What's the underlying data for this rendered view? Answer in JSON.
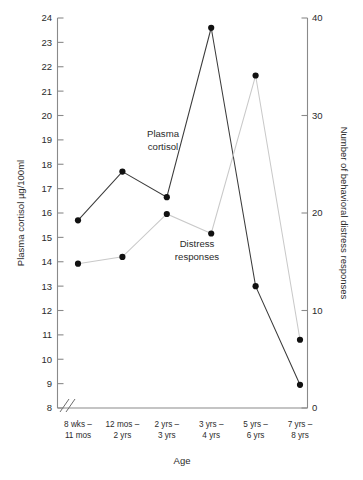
{
  "chart_data": {
    "type": "line",
    "title": "",
    "subtitle": "",
    "xlabel": "Age",
    "ylabel": "Plasma cortisol µg/100ml",
    "y2label": "Number of behavioral distress responses",
    "categories": [
      "8 wks –\n11 mos",
      "12 mos –\n2 yrs",
      "2 yrs –\n3 yrs",
      "3 yrs –\n4 yrs",
      "5 yrs –\n6 yrs",
      "7 yrs –\n8 yrs"
    ],
    "categories_line1": [
      "8 wks –",
      "12 mos –",
      "2 yrs –",
      "3 yrs –",
      "5 yrs –",
      "7 yrs –"
    ],
    "categories_line2": [
      "11 mos",
      "2 yrs",
      "3 yrs",
      "4 yrs",
      "6 yrs",
      "8 yrs"
    ],
    "ylim": [
      8,
      24
    ],
    "yticks": [
      8,
      9,
      10,
      11,
      12,
      13,
      14,
      15,
      16,
      17,
      18,
      19,
      20,
      21,
      22,
      23,
      24
    ],
    "ytick_labels": [
      "8",
      "9",
      "10",
      "11",
      "12",
      "13",
      "14",
      "15",
      "16",
      "17",
      "18",
      "19",
      "20",
      "21",
      "22",
      "23",
      "24"
    ],
    "y2lim": [
      0,
      40
    ],
    "y2ticks": [
      0,
      10,
      20,
      30,
      40
    ],
    "y2tick_labels": [
      "0",
      "10",
      "20",
      "30",
      "40"
    ],
    "y_axis_break": true,
    "grid": false,
    "legend_position": "inline-annotations",
    "series": [
      {
        "name": "Plasma cortisol",
        "axis": "left",
        "color": "#3b3b3b",
        "marker": "filled-circle",
        "values": [
          15.7,
          17.7,
          16.65,
          23.6,
          13.0,
          8.95
        ],
        "label_text": "Plasma\ncortisol",
        "label_line1": "Plasma",
        "label_line2": "cortisol"
      },
      {
        "name": "Distress responses",
        "axis": "right",
        "color": "#c9c9c9",
        "marker": "filled-circle",
        "values": [
          14.8,
          15.5,
          19.9,
          17.9,
          34.1,
          7.0
        ],
        "values_left_axis_equiv": [
          13.9,
          14.2,
          15.95,
          15.15,
          21.65,
          10.8
        ],
        "label_text": "Distress\nresponses",
        "label_line1": "Distress",
        "label_line2": "responses"
      }
    ]
  }
}
